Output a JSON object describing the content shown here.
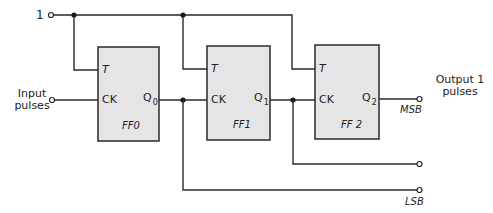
{
  "diagram": {
    "inputs": {
      "logic_one": "1",
      "clock_line1": "Input",
      "clock_line2": "pulses"
    },
    "flip_flops": [
      {
        "name": "FF0",
        "t_label": "T",
        "ck_label": "CK",
        "q_label": "Q",
        "q_sub": "0"
      },
      {
        "name": "FF1",
        "t_label": "T",
        "ck_label": "CK",
        "q_label": "Q",
        "q_sub": "1"
      },
      {
        "name": "FF 2",
        "t_label": "T",
        "ck_label": "CK",
        "q_label": "Q",
        "q_sub": "2"
      }
    ],
    "outputs": {
      "msb": "MSB",
      "lsb": "LSB",
      "title_line1": "Output 1",
      "title_line2": "pulses"
    },
    "colors": {
      "wire": "#2a2a2a",
      "box_fill": "#e5e5e5"
    }
  }
}
